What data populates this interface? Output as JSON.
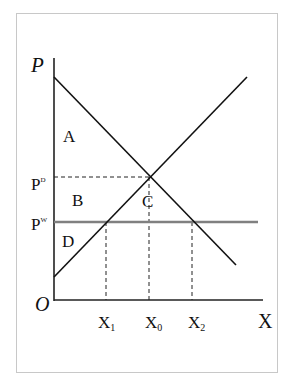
{
  "diagram": {
    "type": "supply-demand",
    "axes": {
      "y_label": "P",
      "x_label": "X",
      "origin_label": "O"
    },
    "price_labels": {
      "p_domestic": {
        "base": "P",
        "sup": "D"
      },
      "p_world": {
        "base": "P",
        "sup": "W"
      }
    },
    "quantity_labels": [
      {
        "base": "X",
        "sub": "1"
      },
      {
        "base": "X",
        "sub": "0"
      },
      {
        "base": "X",
        "sub": "2"
      }
    ],
    "area_labels": [
      "A",
      "B",
      "C",
      "D"
    ],
    "curves": [
      {
        "name": "demand",
        "color": "#111111"
      },
      {
        "name": "supply",
        "color": "#111111"
      },
      {
        "name": "world-price-line",
        "color": "#808080"
      }
    ]
  }
}
